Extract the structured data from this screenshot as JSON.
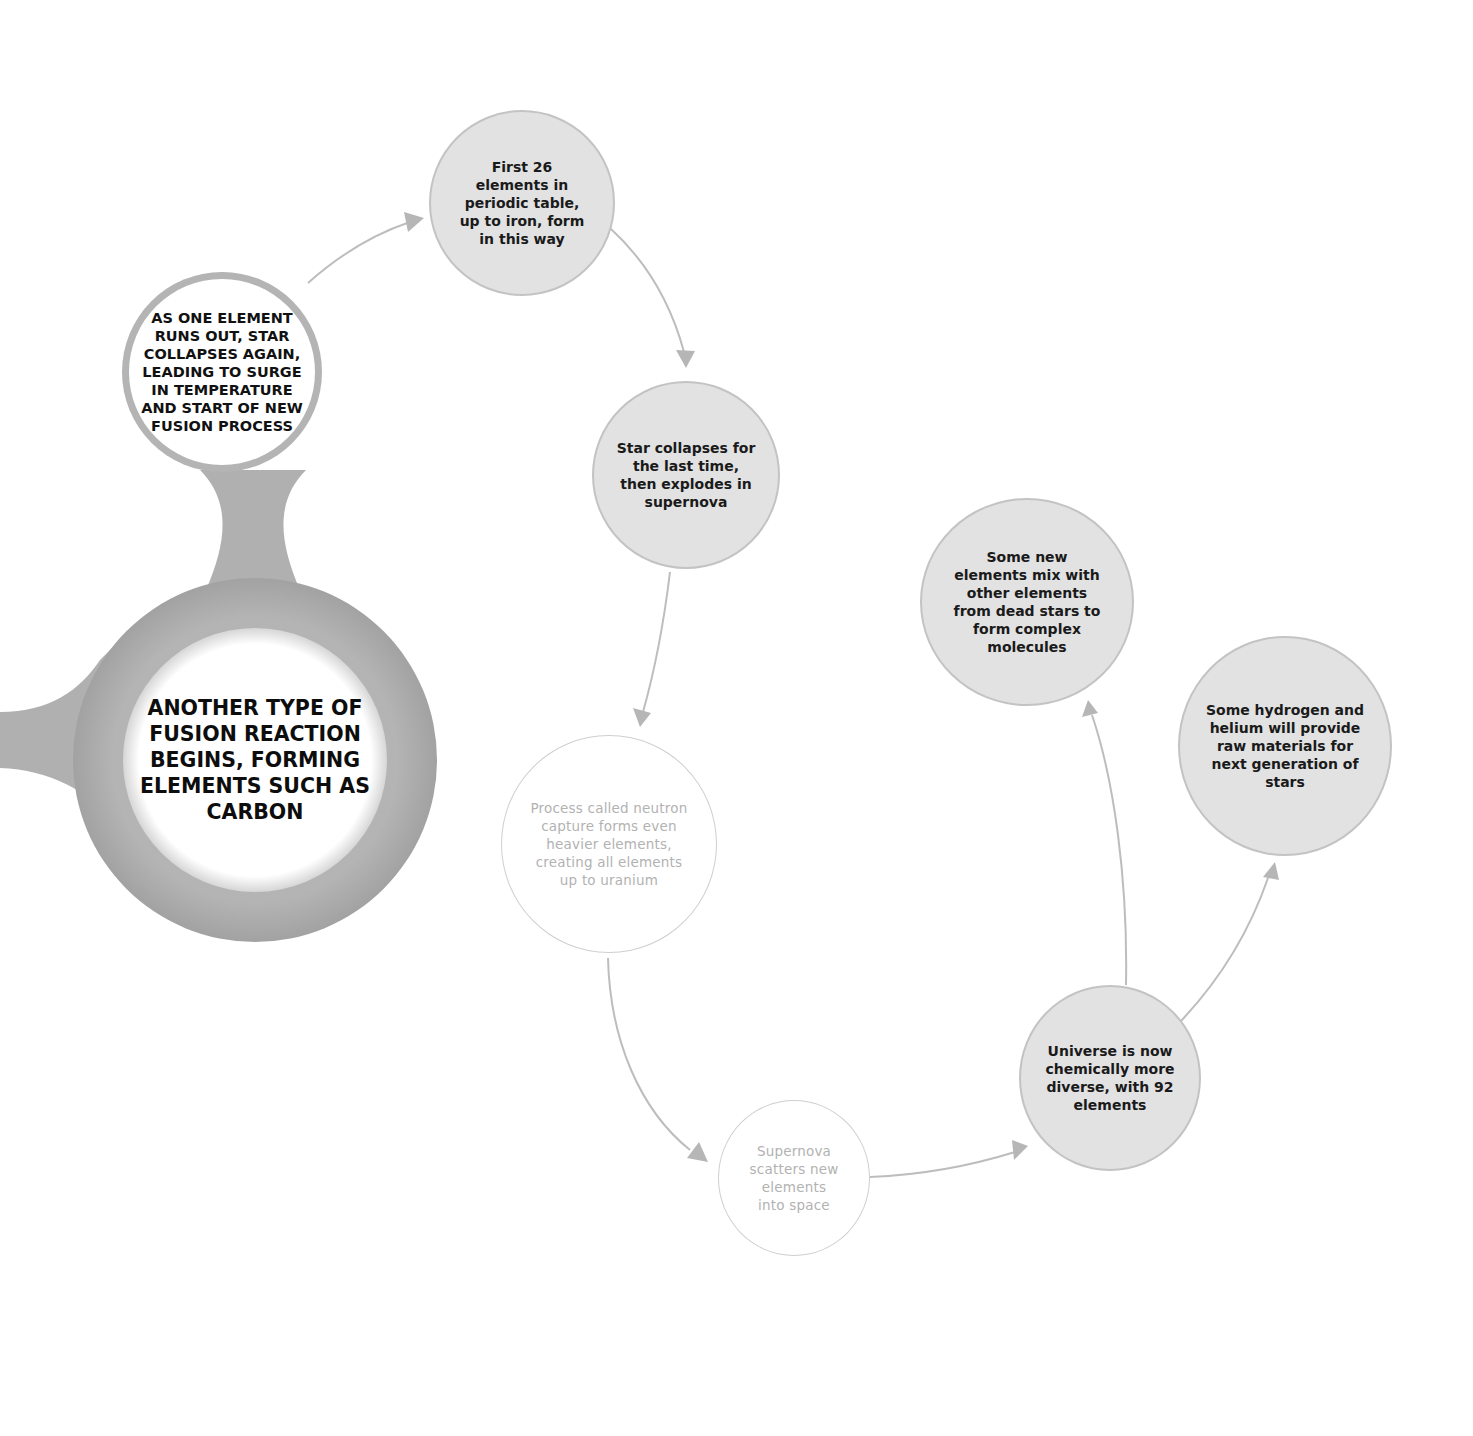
{
  "diagram": {
    "colors": {
      "connector": "#b9b9b9",
      "ring": "#a9a9a9",
      "grey_fill": "#e2e2e2",
      "outline_text": "#b2b2b2",
      "strong_text": "#111111"
    },
    "nodes": {
      "main_stage": {
        "text": "ANOTHER TYPE OF FUSION REACTION BEGINS, FORMING ELEMENTS SUCH AS CARBON"
      },
      "collapse_again": {
        "text": "AS ONE ELEMENT RUNS OUT, STAR COLLAPSES AGAIN, LEADING TO SURGE IN TEMPERATURE AND START OF NEW FUSION PROCESS"
      },
      "first_26": {
        "text": "First 26 elements in periodic table, up to iron, form in this way"
      },
      "last_collapse": {
        "text": "Star collapses for the last time, then explodes in supernova"
      },
      "neutron_capture": {
        "text": "Process called neutron capture forms even heavier elements, creating all elements up to uranium"
      },
      "supernova_scatter": {
        "text": "Supernova scatters new elements into space"
      },
      "universe_diverse": {
        "text": "Universe is now chemically more diverse, with 92 elements"
      },
      "complex_molecules": {
        "text": "Some new elements mix with other elements from dead stars to form complex molecules"
      },
      "next_generation": {
        "text": "Some hydrogen and helium will provide raw materials for next generation of stars"
      }
    },
    "edges": [
      {
        "from": "collapse_again",
        "to": "first_26"
      },
      {
        "from": "first_26",
        "to": "last_collapse"
      },
      {
        "from": "last_collapse",
        "to": "neutron_capture"
      },
      {
        "from": "neutron_capture",
        "to": "supernova_scatter"
      },
      {
        "from": "supernova_scatter",
        "to": "universe_diverse"
      },
      {
        "from": "universe_diverse",
        "to": "complex_molecules"
      },
      {
        "from": "universe_diverse",
        "to": "next_generation"
      }
    ]
  }
}
